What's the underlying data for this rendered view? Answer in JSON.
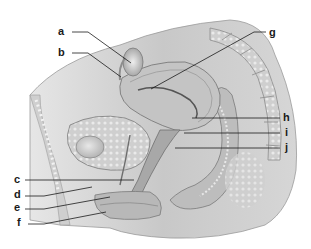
{
  "figure": {
    "type": "anatomical-illustration"
  },
  "labels": [
    {
      "id": "a",
      "text": "a",
      "x": 60,
      "y": 28
    },
    {
      "id": "b",
      "text": "b",
      "x": 60,
      "y": 49
    },
    {
      "id": "g",
      "text": "g",
      "x": 270,
      "y": 29
    },
    {
      "id": "h",
      "text": "h",
      "x": 284,
      "y": 114
    },
    {
      "id": "i",
      "text": "i",
      "x": 285,
      "y": 129
    },
    {
      "id": "j",
      "text": "j",
      "x": 285,
      "y": 144
    },
    {
      "id": "c",
      "text": "c",
      "x": 14,
      "y": 176
    },
    {
      "id": "d",
      "text": "d",
      "x": 14,
      "y": 191
    },
    {
      "id": "e",
      "text": "e",
      "x": 14,
      "y": 204
    },
    {
      "id": "f",
      "text": "f",
      "x": 17,
      "y": 219
    }
  ],
  "colors": {
    "background": "#ffffff",
    "tissue_light": "#d9d9d9",
    "tissue_mid": "#b3b3b3",
    "tissue_dark": "#8c8c8c",
    "leader_line": "#1a1a1a"
  }
}
